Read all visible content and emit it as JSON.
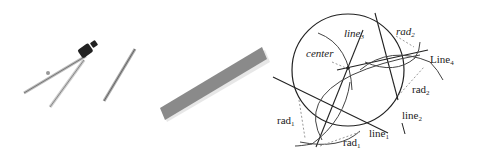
{
  "figure": {
    "panels": [
      {
        "name": "compass-and-pencil",
        "description": "drawing compass and pencil"
      },
      {
        "name": "straightedge",
        "description": "ruler / straightedge bar"
      },
      {
        "name": "construction-diagram",
        "description": "geometric construction of a circle"
      }
    ],
    "labels": {
      "center": "center",
      "line3": "line",
      "line3_sub": "3",
      "rad2_top": "rad",
      "rad2_top_sub": "2",
      "line4": "Line",
      "line4_sub": "4",
      "rad2_right": "rad",
      "rad2_right_sub": "2",
      "line2": "line",
      "line2_sub": "2",
      "rad1_left": "rad",
      "rad1_left_sub": "1",
      "line1": "line",
      "line1_sub": "1",
      "rad1_bottom": "rad",
      "rad1_bottom_sub": "1"
    },
    "colors": {
      "ink": "#222222",
      "ruler": "#8a8a8a",
      "dashed": "#999999"
    }
  }
}
